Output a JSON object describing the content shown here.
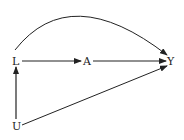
{
  "diagram": {
    "type": "causal-dag",
    "nodes": [
      {
        "id": "L",
        "label": "L"
      },
      {
        "id": "A",
        "label": "A"
      },
      {
        "id": "Y",
        "label": "Y"
      },
      {
        "id": "U",
        "label": "U"
      }
    ],
    "edges": [
      {
        "from": "L",
        "to": "A"
      },
      {
        "from": "A",
        "to": "Y"
      },
      {
        "from": "L",
        "to": "Y",
        "style": "curved"
      },
      {
        "from": "U",
        "to": "L"
      },
      {
        "from": "U",
        "to": "Y"
      }
    ],
    "colors": {
      "stroke": "#222222",
      "background": "#ffffff"
    }
  }
}
